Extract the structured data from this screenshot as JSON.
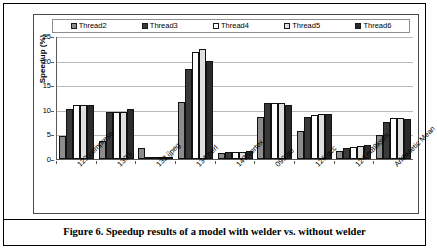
{
  "caption": "Figure 6. Speedup results of a model with welder vs. without welder",
  "chart_data": {
    "type": "bar",
    "title": "",
    "xlabel": "",
    "ylabel": "Speedup (%)",
    "ylim": [
      0,
      25
    ],
    "yticks": [
      0,
      5,
      10,
      15,
      20,
      25
    ],
    "ytick_labels": [
      "0",
      "5",
      "10",
      "15",
      "20",
      "25"
    ],
    "grid": true,
    "legend_position": "top",
    "categories": [
      "129.compress",
      "130.li",
      "132.ijpeg",
      "134.perl",
      "147.vortex",
      "099.go",
      "126.gcc",
      "124.m88ksim",
      "Arithmetic Mean"
    ],
    "series": [
      {
        "name": "Thread2",
        "color": "#8c8c8c",
        "values": [
          4.7,
          3.6,
          2.3,
          11.6,
          1.2,
          8.6,
          5.7,
          1.7,
          4.9
        ]
      },
      {
        "name": "Thread3",
        "color": "#3a3a3a",
        "values": [
          10.2,
          9.6,
          0.1,
          18.2,
          1.4,
          11.4,
          8.5,
          2.3,
          7.6
        ]
      },
      {
        "name": "Thread4",
        "color": "#ffffff",
        "values": [
          11.0,
          9.5,
          0.1,
          21.7,
          1.4,
          11.4,
          9.0,
          2.4,
          8.4
        ]
      },
      {
        "name": "Thread5",
        "color": "#e0e0e0",
        "values": [
          11.0,
          9.6,
          0.1,
          22.4,
          1.4,
          11.4,
          9.2,
          2.7,
          8.4
        ]
      },
      {
        "name": "Thread6",
        "color": "#2b2b2b",
        "values": [
          11.0,
          10.1,
          0.1,
          19.9,
          1.7,
          11.0,
          9.2,
          2.8,
          8.2
        ]
      }
    ]
  }
}
